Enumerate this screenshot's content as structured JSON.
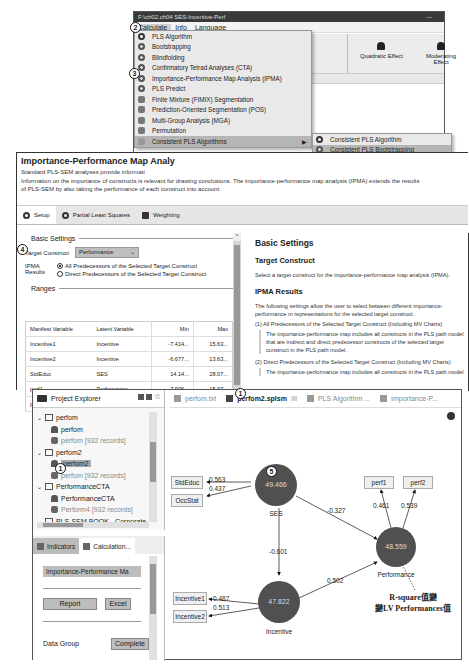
{
  "top_window": {
    "title": "F:\\ch02,ch04 SES-Incentive-Perf",
    "menubar": [
      "Calculate",
      "Info",
      "Language"
    ],
    "ribbon_buttons": [
      "Quadratic Effect",
      "Moderating Effect"
    ],
    "calculate_menu": [
      {
        "label": "PLS Algorithm",
        "icon": "ring-icon"
      },
      {
        "label": "Bootstrapping",
        "icon": "gear-icon"
      },
      {
        "label": "Blindfolding",
        "icon": "gear-icon"
      },
      {
        "label": "Confirmatory Tetrad Analyses (CTA)",
        "icon": "gear-icon"
      },
      {
        "label": "Importance-Performance Map Analysis (IPMA)",
        "icon": "gear-icon"
      },
      {
        "label": "PLS Predict",
        "icon": "gear-icon"
      },
      {
        "label": "Finite Mixture (FIMIX) Segmentation",
        "icon": "disk-icon"
      },
      {
        "label": "Prediction-Oriented Segmentation (POS)",
        "icon": "disk-icon"
      },
      {
        "label": "Multi-Group Analysis (MGA)",
        "icon": "disk-icon"
      },
      {
        "label": "Permutation",
        "icon": "disk-icon"
      },
      {
        "label": "Consistent PLS Algorithms",
        "icon": "folder-icon",
        "has_submenu": true
      }
    ],
    "submenu": [
      {
        "label": "Consistent PLS Algorithm",
        "icon": "ring-icon"
      },
      {
        "label": "Consistent PLS Bootstrapping",
        "icon": "gear-icon",
        "highlighted": true
      },
      {
        "label": "Consistent Multi-Group Analysis (MGAc)",
        "icon": "disk-icon"
      },
      {
        "label": "Consistent Permutation",
        "icon": "disk-icon"
      }
    ]
  },
  "ipma_window": {
    "title": "Importance-Performance Map Analy",
    "desc_line1": "Standard PLS-SEM analyses provide informati",
    "desc_line2": "Information on the importance of constructs is relevant for drawing conclusions. The importance-performance map analysis (IPMA) extends the results",
    "desc_line3": "of PLS-SEM by also taking the performance of each construct into account.",
    "tabs": [
      "Setup",
      "Partial Least Squares",
      "Weighting"
    ],
    "basic_settings_label": "Basic Settings",
    "target_construct_label": "Target Construct",
    "target_construct_value": "Performance",
    "ipma_results_label": "IPMA Results",
    "radio_options": [
      {
        "label": "All Predecessors of the Selected Target Construct",
        "selected": true
      },
      {
        "label": "Direct Predecessors of the Selected Target Construct",
        "selected": false
      }
    ],
    "ranges_label": "Ranges",
    "ranges_headers": [
      "Manifest Variable",
      "Latent Variable",
      "Min",
      "Max"
    ],
    "ranges_rows": [
      [
        "Incentive1",
        "Incentive",
        "-7.414...",
        "15.63..."
      ],
      [
        "Incentive2",
        "Incentive",
        "-6.677...",
        "13.63..."
      ],
      [
        "StdEduc",
        "SES",
        "14.14...",
        "28.07..."
      ],
      [
        "perf1",
        "Performance",
        "-7.906...",
        "15.07..."
      ],
      [
        "perf2",
        "",
        "",
        ""
      ]
    ],
    "help": {
      "h1": "Basic Settings",
      "h2a": "Target Construct",
      "p1": "Select a target construct for the importance-performance map analysis (IPMA).",
      "h2b": "IPMA Results",
      "p2": "The following settings allow the user to select between different importance-performance m representations for the selected target construct.",
      "item1": "(1) All Predecessors of the Selected Target Construct (Including MV Charts)",
      "quote1": "The importance-performance map includes all constructs in the PLS path model that are indirect and direct predecessor constructs of the selected target construct in the PLS path model.",
      "item2": "(2) Direct Predecessors of the Selected Target Construct (Including MV Charts)",
      "quote2": "The importance-performance map includes all constructs in the PLS path model"
    }
  },
  "bottom_window": {
    "project_explorer_title": "Project Explorer",
    "tree": [
      {
        "type": "project",
        "label": "perfom"
      },
      {
        "type": "model",
        "label": "perfom"
      },
      {
        "type": "data",
        "label": "perfom [932 records]"
      },
      {
        "type": "project",
        "label": "perfom2"
      },
      {
        "type": "model",
        "label": "perfom2",
        "selected": true
      },
      {
        "type": "data",
        "label": "perfom [932 records]"
      },
      {
        "type": "project",
        "label": "PerformanceCTA"
      },
      {
        "type": "model",
        "label": "PerformanceCTA"
      },
      {
        "type": "data",
        "label": "Perform4 [932 records]"
      },
      {
        "type": "project",
        "label": "PLS-SEM BOOK - Corporate"
      }
    ],
    "calc_tabs": [
      "Indicators",
      "Calculation..."
    ],
    "calc_field": "Importance-Performance Ma",
    "report_button": "Report",
    "excel_button": "Excel",
    "data_group_label": "Data Group",
    "data_group_value": "Complete",
    "editor_tabs": [
      {
        "label": "perfom.txt",
        "active": false
      },
      {
        "label": "perfom2.splsm",
        "active": true,
        "closable": true
      },
      {
        "label": "PLS Algorithm ...",
        "active": false
      },
      {
        "label": "Importance-P...",
        "active": false
      }
    ]
  },
  "path_model": {
    "latent_variables": [
      {
        "name": "SES",
        "value": "49.466"
      },
      {
        "name": "Incentive",
        "value": "47.822"
      },
      {
        "name": "Performance",
        "value": "48.559"
      }
    ],
    "indicators": [
      "StdEduc",
      "OccStat",
      "Incentive1",
      "Incentive2",
      "perf1",
      "perf2"
    ],
    "loadings": {
      "StdEduc": "0.563",
      "OccStat": "0.437",
      "Incentive1": "0.487",
      "Incentive2": "0.513",
      "perf1": "0.461",
      "perf2": "0.539"
    },
    "paths": {
      "SES_to_Performance": "-0.327",
      "SES_to_Incentive": "-0.601",
      "Incentive_to_Performance": "0.502"
    },
    "annotation_line1": "R-square值變",
    "annotation_line2": "變LV Performances值"
  },
  "callouts": [
    "1",
    "2",
    "3",
    "4",
    "5"
  ],
  "colors": {
    "lv_fill": "#505050",
    "menu_bg": "#e9e9e9",
    "menu_highlight": "#b5b5b5"
  }
}
